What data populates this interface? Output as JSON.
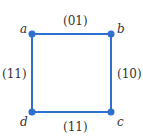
{
  "graph": {
    "edge_color": "#2f6fce",
    "nodes": [
      {
        "id": "a",
        "label": "a",
        "x": 32,
        "y": 34
      },
      {
        "id": "b",
        "label": "b",
        "x": 111,
        "y": 34
      },
      {
        "id": "c",
        "label": "c",
        "x": 111,
        "y": 112
      },
      {
        "id": "d",
        "label": "d",
        "x": 32,
        "y": 112
      }
    ],
    "edges": [
      {
        "from": "a",
        "to": "b",
        "label": "(01)"
      },
      {
        "from": "b",
        "to": "c",
        "label": "(10)"
      },
      {
        "from": "d",
        "to": "c",
        "label": "(11)"
      },
      {
        "from": "a",
        "to": "d",
        "label": "(11)"
      }
    ]
  }
}
